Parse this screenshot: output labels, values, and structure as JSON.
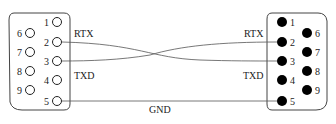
{
  "diagram": {
    "type": "DB9 serial null-modem wiring",
    "colors": {
      "line": "#444444",
      "text": "#222222",
      "pin_fill": "#000000",
      "background": "#ffffff"
    },
    "left_connector": {
      "style": "hollow-pins",
      "pins_top_row": [
        {
          "num": "1",
          "x": 57,
          "y": 22
        },
        {
          "num": "2",
          "x": 57,
          "y": 42
        },
        {
          "num": "3",
          "x": 57,
          "y": 61
        },
        {
          "num": "4",
          "x": 57,
          "y": 80
        },
        {
          "num": "5",
          "x": 57,
          "y": 101
        }
      ],
      "pins_bottom_row": [
        {
          "num": "6",
          "x": 30,
          "y": 33
        },
        {
          "num": "7",
          "x": 30,
          "y": 52
        },
        {
          "num": "8",
          "x": 30,
          "y": 71
        },
        {
          "num": "9",
          "x": 30,
          "y": 90
        }
      ]
    },
    "right_connector": {
      "style": "filled-pins",
      "pins_top_row": [
        {
          "num": "1",
          "x": 282,
          "y": 22
        },
        {
          "num": "2",
          "x": 282,
          "y": 42
        },
        {
          "num": "3",
          "x": 282,
          "y": 61
        },
        {
          "num": "4",
          "x": 282,
          "y": 80
        },
        {
          "num": "5",
          "x": 282,
          "y": 101
        }
      ],
      "pins_bottom_row": [
        {
          "num": "6",
          "x": 307,
          "y": 33
        },
        {
          "num": "7",
          "x": 307,
          "y": 52
        },
        {
          "num": "8",
          "x": 307,
          "y": 71
        },
        {
          "num": "9",
          "x": 307,
          "y": 90
        }
      ]
    },
    "labels": {
      "left_rtx": "RTX",
      "left_txd": "TXD",
      "right_rtx": "RTX",
      "right_txd": "TXD",
      "gnd": "GND"
    },
    "connections": [
      {
        "from": "left pin 2",
        "to": "right pin 3"
      },
      {
        "from": "left pin 3",
        "to": "right pin 2"
      },
      {
        "from": "left pin 5",
        "to": "right pin 5",
        "label": "GND"
      }
    ]
  }
}
